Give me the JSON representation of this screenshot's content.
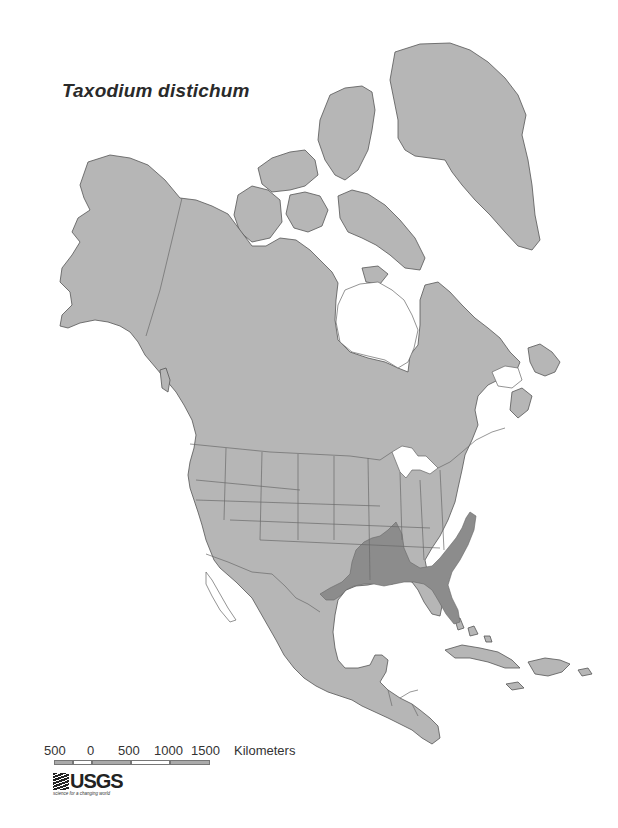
{
  "map": {
    "title": "Taxodium distichum",
    "subject": "Species range map (bald cypress) over North America",
    "colors": {
      "land": "#b6b6b6",
      "range": "#8c8c8c",
      "water": "#ffffff",
      "outline": "#555555"
    },
    "legend_regions": [
      "North America base map",
      "Taxodium distichum range (southeastern United States)"
    ]
  },
  "scale_bar": {
    "labels": [
      "500",
      "0",
      "500",
      "1000",
      "1500"
    ],
    "unit": "Kilometers"
  },
  "logo": {
    "name": "USGS",
    "tagline": "science for a changing world"
  }
}
